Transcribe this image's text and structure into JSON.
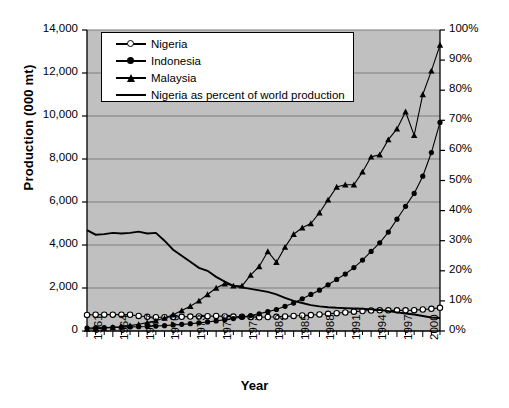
{
  "chart_data": {
    "type": "line",
    "title": "",
    "xlabel": "Year",
    "ylabel": "Production (000 mt)",
    "ylabel_right": "",
    "ylim": [
      0,
      14000
    ],
    "ylim_right": [
      0,
      100
    ],
    "xlim": [
      1961,
      2002
    ],
    "grid": true,
    "legend_position": "top-left-inside",
    "plot_background": "#c0c0c0",
    "line_color": "#000000",
    "y_ticks_left": [
      "0",
      "2,000",
      "4,000",
      "6,000",
      "8,000",
      "10,000",
      "12,000",
      "14,000"
    ],
    "y_tick_values_left": [
      0,
      2000,
      4000,
      6000,
      8000,
      10000,
      12000,
      14000
    ],
    "y_ticks_right": [
      "0%",
      "10%",
      "20%",
      "30%",
      "40%",
      "50%",
      "60%",
      "70%",
      "80%",
      "90%",
      "100%"
    ],
    "y_tick_values_right": [
      0,
      10,
      20,
      30,
      40,
      50,
      60,
      70,
      80,
      90,
      100
    ],
    "x_tick_labels": [
      "1961",
      "1964",
      "1967",
      "1970",
      "1973",
      "1976",
      "1979",
      "1982",
      "1985",
      "1988",
      "1991",
      "1994",
      "1997",
      "2000"
    ],
    "x_tick_values": [
      1961,
      1964,
      1967,
      1970,
      1973,
      1976,
      1979,
      1982,
      1985,
      1988,
      1991,
      1994,
      1997,
      2000
    ],
    "x": [
      1961,
      1962,
      1963,
      1964,
      1965,
      1966,
      1967,
      1968,
      1969,
      1970,
      1971,
      1972,
      1973,
      1974,
      1975,
      1976,
      1977,
      1978,
      1979,
      1980,
      1981,
      1982,
      1983,
      1984,
      1985,
      1986,
      1987,
      1988,
      1989,
      1990,
      1991,
      1992,
      1993,
      1994,
      1995,
      1996,
      1997,
      1998,
      1999,
      2000,
      2001,
      2002
    ],
    "series": [
      {
        "name": "Nigeria",
        "axis": "left",
        "marker": "open-circle",
        "values": [
          750,
          755,
          760,
          760,
          760,
          755,
          700,
          660,
          640,
          640,
          650,
          660,
          670,
          680,
          690,
          700,
          680,
          670,
          660,
          650,
          640,
          650,
          660,
          680,
          700,
          720,
          740,
          770,
          800,
          830,
          860,
          900,
          930,
          950,
          960,
          960,
          960,
          960,
          970,
          1000,
          1030,
          1080
        ]
      },
      {
        "name": "Indonesia",
        "axis": "left",
        "marker": "filled-circle",
        "values": [
          140,
          150,
          160,
          170,
          180,
          190,
          200,
          210,
          230,
          250,
          280,
          310,
          340,
          380,
          420,
          470,
          520,
          580,
          650,
          720,
          800,
          900,
          1000,
          1150,
          1300,
          1500,
          1700,
          1900,
          2150,
          2400,
          2650,
          2950,
          3300,
          3700,
          4100,
          4600,
          5200,
          5800,
          6400,
          7200,
          8300,
          9700
        ]
      },
      {
        "name": "Malaysia",
        "axis": "left",
        "marker": "filled-triangle",
        "values": [
          95,
          110,
          130,
          160,
          200,
          250,
          310,
          390,
          480,
          600,
          760,
          950,
          1150,
          1400,
          1700,
          2000,
          2200,
          2100,
          2100,
          2600,
          3000,
          3700,
          3200,
          3900,
          4500,
          4800,
          5000,
          5500,
          6100,
          6700,
          6800,
          6800,
          7400,
          8100,
          8200,
          8900,
          9400,
          10200,
          9100,
          11000,
          12100,
          13300
        ]
      },
      {
        "name": "Nigeria as percent of world production",
        "axis": "right",
        "marker": "none",
        "values": [
          33.5,
          32.0,
          32.2,
          32.6,
          32.4,
          32.6,
          33.0,
          32.4,
          32.6,
          30.0,
          27.0,
          25.0,
          23.0,
          21.0,
          20.0,
          18.0,
          16.4,
          15.0,
          14.5,
          14.0,
          13.5,
          13.0,
          12.2,
          11.0,
          10.0,
          9.3,
          8.6,
          8.2,
          7.9,
          7.7,
          7.6,
          7.5,
          7.4,
          7.2,
          7.0,
          6.6,
          6.2,
          5.8,
          5.5,
          5.0,
          4.5,
          4.3
        ]
      }
    ]
  },
  "legend": {
    "items": [
      {
        "label": "Nigeria",
        "marker": "open-circle"
      },
      {
        "label": "Indonesia",
        "marker": "filled-circle"
      },
      {
        "label": "Malaysia",
        "marker": "filled-triangle"
      },
      {
        "label": "Nigeria as percent of world production",
        "marker": "line"
      }
    ]
  }
}
